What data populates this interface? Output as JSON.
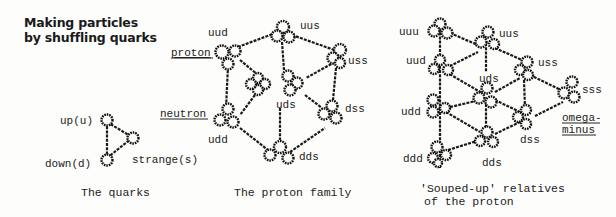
{
  "title": {
    "line1": "Making particles",
    "line2": "by shuffling quarks"
  },
  "panels": [
    {
      "id": "quarks",
      "caption": "The quarks",
      "labels": {
        "up": "up(u)",
        "down": "down(d)",
        "strange": "strange(s)"
      }
    },
    {
      "id": "proton-family",
      "caption": "The proton family",
      "labels": {
        "uud": "uud",
        "uus": "uus",
        "uss": "uss",
        "uds": "uds",
        "dss": "dss",
        "udd": "udd",
        "dds": "dds",
        "proton": "proton",
        "neutron": "neutron"
      }
    },
    {
      "id": "souped-up",
      "caption_line1": "'Souped-up' relatives",
      "caption_line2": "of the proton",
      "labels": {
        "uuu": "uuu",
        "uus": "uus",
        "uud": "uud",
        "uds": "uds",
        "uss": "uss",
        "sss": "sss",
        "udd": "udd",
        "dss": "dss",
        "ddd": "ddd",
        "dds": "dds",
        "omega1": "omega-",
        "omega2": "minus"
      }
    }
  ]
}
